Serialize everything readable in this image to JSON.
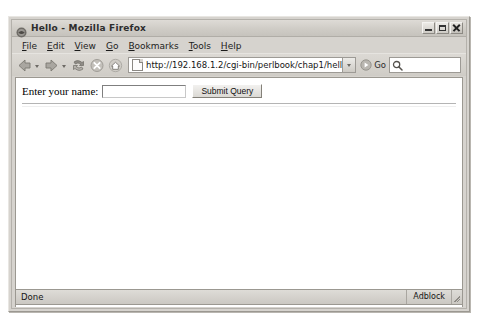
{
  "window": {
    "title": "Hello - Mozilla Firefox",
    "title_icon": "firefox-globe-icon",
    "controls": {
      "minimize": "minimize-button",
      "maximize": "maximize-button",
      "close": "close-button"
    }
  },
  "menubar": {
    "items": [
      {
        "label": "File",
        "accel": "F",
        "rest": "ile"
      },
      {
        "label": "Edit",
        "accel": "E",
        "rest": "dit"
      },
      {
        "label": "View",
        "accel": "V",
        "rest": "iew"
      },
      {
        "label": "Go",
        "accel": "G",
        "rest": "o"
      },
      {
        "label": "Bookmarks",
        "accel": "B",
        "rest": "ookmarks"
      },
      {
        "label": "Tools",
        "accel": "T",
        "rest": "ools"
      },
      {
        "label": "Help",
        "accel": "H",
        "rest": "elp"
      }
    ]
  },
  "toolbar": {
    "back": "back-arrow-icon",
    "forward": "forward-arrow-icon",
    "reload": "reload-icon",
    "stop": "stop-icon",
    "home": "home-icon",
    "url": "http://192.168.1.2/cgi-bin/perlbook/chap1/helloname.cgi",
    "url_placeholder": "",
    "go_label": "Go",
    "go_icon": "go-arrow-icon",
    "search_value": "",
    "search_placeholder": "",
    "search_icon": "search-magnifier-icon"
  },
  "page": {
    "label": "Enter your name:",
    "input_value": "",
    "input_placeholder": "",
    "submit_label": "Submit Query"
  },
  "statusbar": {
    "status": "Done",
    "adblock": "Adblock"
  },
  "colors": {
    "chrome": "#d6d3ce",
    "page_background": "#ffffff",
    "desktop": "#ffffff",
    "border": "#9b9891"
  }
}
